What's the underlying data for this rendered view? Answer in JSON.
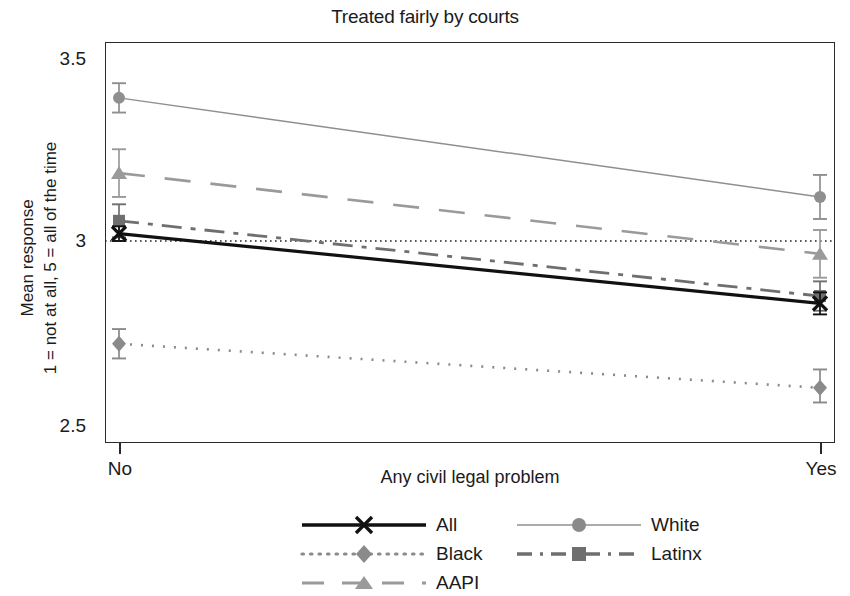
{
  "chart": {
    "title": "Treated fairly by courts",
    "xlabel": "Any civil legal problem",
    "ylabel_line1": "Mean response",
    "ylabel_line2": "1 = not at all, 5 = all of the time",
    "xticks": [
      "No",
      "Yes"
    ],
    "yticks": [
      "3.5",
      "3",
      "2.5"
    ]
  },
  "legend": {
    "all": "All",
    "black": "Black",
    "aapi": "AAPI",
    "white": "White",
    "latinx": "Latinx"
  },
  "chart_data": {
    "type": "line",
    "title": "Treated fairly by courts",
    "xlabel": "Any civil legal problem",
    "ylabel": "Mean response 1 = not at all, 5 = all of the time",
    "categories": [
      "No",
      "Yes"
    ],
    "x": [
      0,
      1
    ],
    "ylim": [
      2.5,
      3.5
    ],
    "yticks": [
      2.5,
      3.0,
      3.5
    ],
    "grid": false,
    "legend_position": "bottom",
    "reference_line": {
      "y": 3.0,
      "style": "dotted"
    },
    "series": [
      {
        "name": "All",
        "values": [
          3.02,
          2.83
        ],
        "errors_low": [
          3.0,
          2.8
        ],
        "errors_high": [
          3.04,
          2.86
        ],
        "color": "#111111",
        "linestyle": "solid",
        "marker": "x",
        "linewidth": 3.2
      },
      {
        "name": "Black",
        "values": [
          2.72,
          2.6
        ],
        "errors_low": [
          2.68,
          2.56
        ],
        "errors_high": [
          2.76,
          2.65
        ],
        "color": "#8a8a8a",
        "linestyle": "dotted",
        "marker": "diamond",
        "linewidth": 2.6
      },
      {
        "name": "AAPI",
        "values": [
          3.185,
          2.965
        ],
        "errors_low": [
          3.12,
          2.9
        ],
        "errors_high": [
          3.25,
          3.03
        ],
        "color": "#9a9a9a",
        "linestyle": "dashed",
        "marker": "triangle",
        "linewidth": 2.6
      },
      {
        "name": "White",
        "values": [
          3.39,
          3.12
        ],
        "errors_low": [
          3.35,
          3.06
        ],
        "errors_high": [
          3.43,
          3.18
        ],
        "color": "#8f8f8f",
        "linestyle": "solid-thin",
        "marker": "circle",
        "linewidth": 1.5
      },
      {
        "name": "Latinx",
        "values": [
          3.055,
          2.85
        ],
        "errors_low": [
          3.01,
          2.81
        ],
        "errors_high": [
          3.1,
          2.89
        ],
        "color": "#6f6f6f",
        "linestyle": "dash-dot",
        "marker": "square",
        "linewidth": 2.8
      }
    ]
  }
}
